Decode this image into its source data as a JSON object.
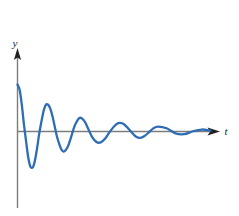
{
  "figure": {
    "kind": "damped-oscillation-graph",
    "background_color": "#ffffff",
    "width": 239,
    "height": 216
  },
  "axes": {
    "x_axis": {
      "name": "t-axis",
      "label": "t",
      "color": "#7d7d7d",
      "arrow": true
    },
    "y_axis": {
      "name": "y-axis",
      "label": "y",
      "color": "#7d7d7d",
      "arrow": true
    }
  },
  "chart_data": {
    "type": "line",
    "title": "",
    "subtitle": "",
    "xlabel": "t",
    "ylabel": "y",
    "grid": false,
    "legend": null,
    "legend_position": "none",
    "xlim": [
      0,
      5.6
    ],
    "ylim": [
      -1.05,
      1.05
    ],
    "x_ticks": [],
    "y_ticks": [],
    "annotations": [],
    "curve_color": "#2e6db4",
    "curve_width": 2.3,
    "model": {
      "amplitude": 1.0,
      "decay_rate": 0.62,
      "angular_frequency": 6.28,
      "phase": 0.0,
      "form": "y = exp(-0.62 t) cos(6.28 t)"
    },
    "series": [
      {
        "name": "damped oscillation",
        "x": [
          0.0,
          0.06,
          0.12,
          0.18,
          0.25,
          0.31,
          0.37,
          0.44,
          0.5,
          0.56,
          0.62,
          0.69,
          0.75,
          0.81,
          0.87,
          0.94,
          1.0,
          1.06,
          1.12,
          1.19,
          1.25,
          1.31,
          1.37,
          1.44,
          1.5,
          1.56,
          1.62,
          1.69,
          1.75,
          1.81,
          1.87,
          1.94,
          2.0,
          2.12,
          2.25,
          2.37,
          2.5,
          2.62,
          2.75,
          2.87,
          3.0,
          3.12,
          3.25,
          3.37,
          3.5,
          3.62,
          3.75,
          3.87,
          4.0,
          4.25,
          4.5,
          4.75,
          5.0,
          5.25,
          5.5
        ],
        "y": [
          1.0,
          0.889,
          0.586,
          0.175,
          -0.242,
          -0.57,
          -0.749,
          -0.757,
          -0.606,
          -0.345,
          -0.041,
          0.243,
          0.456,
          0.568,
          0.572,
          0.478,
          0.314,
          0.112,
          -0.094,
          -0.268,
          -0.383,
          -0.427,
          -0.399,
          -0.311,
          -0.183,
          -0.037,
          0.102,
          0.212,
          0.277,
          0.291,
          0.256,
          0.18,
          0.081,
          -0.107,
          -0.222,
          -0.232,
          -0.149,
          -0.018,
          0.107,
          0.177,
          0.169,
          0.093,
          -0.015,
          -0.105,
          -0.134,
          -0.095,
          -0.014,
          0.066,
          0.104,
          0.068,
          -0.04,
          -0.058,
          0.005,
          0.042,
          0.018
        ]
      }
    ]
  },
  "labels": {
    "y_label_text": "y",
    "t_label_text": "t"
  }
}
